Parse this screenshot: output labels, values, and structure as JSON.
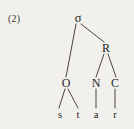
{
  "figure": {
    "example_number": "(2)",
    "background_color": "#f2f0ec",
    "ink_color": "#241f1a",
    "line_color": "#4a443d",
    "word": "star"
  },
  "tree": {
    "root": {
      "id": "sigma",
      "label": "σ",
      "name": "syllable"
    },
    "nodes": [
      {
        "id": "sigma",
        "label": "σ",
        "x": 78,
        "y": 18
      },
      {
        "id": "rime",
        "label": "R",
        "x": 106,
        "y": 48
      },
      {
        "id": "onset",
        "label": "O",
        "x": 66,
        "y": 83
      },
      {
        "id": "nucleus",
        "label": "N",
        "x": 96,
        "y": 83
      },
      {
        "id": "coda",
        "label": "C",
        "x": 115,
        "y": 83
      }
    ],
    "terminals": [
      {
        "id": "seg-s",
        "label": "s",
        "x": 60,
        "y": 114
      },
      {
        "id": "seg-t",
        "label": "t",
        "x": 78,
        "y": 114
      },
      {
        "id": "seg-a",
        "label": "a",
        "x": 96,
        "y": 114
      },
      {
        "id": "seg-r",
        "label": "r",
        "x": 115,
        "y": 114
      }
    ],
    "branches": [
      {
        "id": "sigma-onset",
        "from": "sigma",
        "to": "onset",
        "x1": 76,
        "y1": 24,
        "x2": 66,
        "y2": 77
      },
      {
        "id": "sigma-rime",
        "from": "sigma",
        "to": "rime",
        "x1": 81,
        "y1": 24,
        "x2": 104,
        "y2": 42
      },
      {
        "id": "rime-nucleus",
        "from": "rime",
        "to": "nucleus",
        "x1": 104,
        "y1": 54,
        "x2": 96,
        "y2": 77
      },
      {
        "id": "rime-coda",
        "from": "rime",
        "to": "coda",
        "x1": 108,
        "y1": 54,
        "x2": 116,
        "y2": 77
      },
      {
        "id": "onset-s",
        "from": "onset",
        "to": "seg-s",
        "x1": 65,
        "y1": 89,
        "x2": 59,
        "y2": 108
      },
      {
        "id": "onset-t",
        "from": "onset",
        "to": "seg-t",
        "x1": 68,
        "y1": 89,
        "x2": 78,
        "y2": 108
      },
      {
        "id": "nucleus-a",
        "from": "nucleus",
        "to": "seg-a",
        "x1": 96,
        "y1": 89,
        "x2": 96,
        "y2": 108
      },
      {
        "id": "coda-r",
        "from": "coda",
        "to": "seg-r",
        "x1": 115,
        "y1": 89,
        "x2": 115,
        "y2": 108
      }
    ]
  }
}
